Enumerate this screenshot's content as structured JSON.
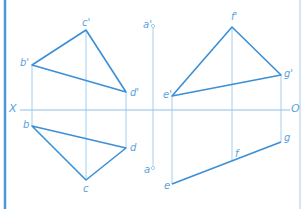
{
  "colors": {
    "thick_line": "#3b8fd6",
    "thin_line": "#8ec2ea",
    "axis": "#7db8e6",
    "border_left": "#4a97d9",
    "border_right": "#a9cdee",
    "label": "#5ba3dc"
  },
  "axis": {
    "left_label": "X",
    "right_label": "O"
  },
  "left_figure": {
    "front_view": {
      "points": [
        {
          "name": "b'",
          "x": 32,
          "y": 65
        },
        {
          "name": "c'",
          "x": 86,
          "y": 30
        },
        {
          "name": "d'",
          "x": 126,
          "y": 92
        }
      ]
    },
    "top_view": {
      "points": [
        {
          "name": "b",
          "x": 32,
          "y": 126
        },
        {
          "name": "c",
          "x": 86,
          "y": 180
        },
        {
          "name": "d",
          "x": 126,
          "y": 148
        }
      ]
    }
  },
  "point_a": {
    "front": {
      "name": "a'",
      "x": 153,
      "y": 26
    },
    "top": {
      "name": "a",
      "x": 153,
      "y": 168
    }
  },
  "right_figure": {
    "front_view": {
      "points": [
        {
          "name": "e'",
          "x": 172,
          "y": 96
        },
        {
          "name": "f'",
          "x": 232,
          "y": 27
        },
        {
          "name": "g'",
          "x": 281,
          "y": 75
        }
      ]
    },
    "top_view": {
      "points": [
        {
          "name": "e",
          "x": 172,
          "y": 184
        },
        {
          "name": "f",
          "x": 232,
          "y": 162
        },
        {
          "name": "g",
          "x": 281,
          "y": 142
        }
      ]
    }
  },
  "labels": {
    "b_prime": "b'",
    "c_prime": "c'",
    "d_prime": "d'",
    "b": "b",
    "c": "c",
    "d": "d",
    "a_prime": "a'",
    "a": "a",
    "e_prime": "e'",
    "f_prime": "f'",
    "g_prime": "g'",
    "e": "e",
    "f": "f",
    "g": "g"
  }
}
